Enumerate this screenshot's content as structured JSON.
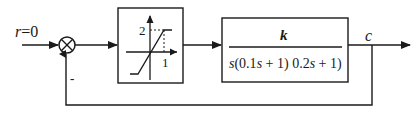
{
  "diagram": {
    "type": "closed-loop control block diagram",
    "input": {
      "label": "r=0",
      "symbol": "r",
      "value": "0"
    },
    "summing_junction": {
      "symbol": "⊗",
      "feedback_sign": "-"
    },
    "saturation_block": {
      "name": "saturation nonlinearity",
      "y_tick": "2",
      "x_tick": "1"
    },
    "transfer_function_block": {
      "numerator": "k",
      "denominator": "s(0.1s + 1) 0.2s + 1)"
    },
    "output": {
      "label": "c"
    },
    "colors": {
      "line": "#1a1a1a",
      "background": "#ffffff"
    }
  }
}
